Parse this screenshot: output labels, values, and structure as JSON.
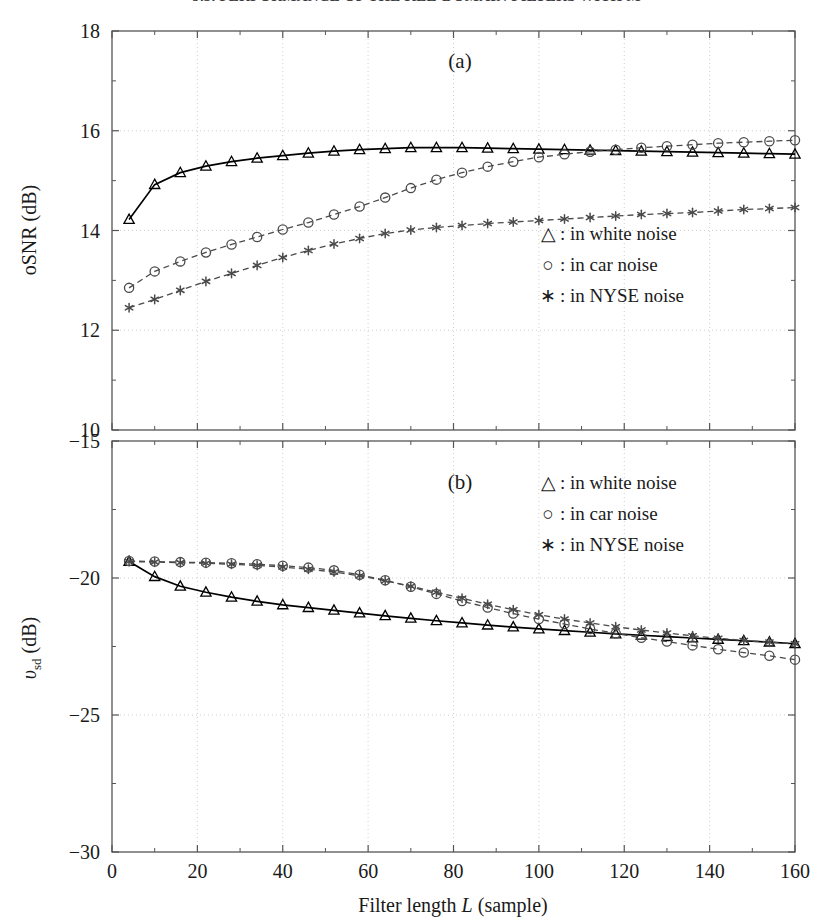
{
  "running_head": "9.5. PERFORMANCE OF THE KLE-DOMAIN FILTERS WITH M",
  "figure": {
    "xlabel_pre": "Filter length ",
    "xlabel_var": "L",
    "xlabel_post": " (sample)",
    "panels": [
      {
        "id": "a",
        "label": "(a)",
        "ylabel_main": "oSNR (dB)",
        "legend": [
          {
            "symbol": "△",
            "text": ": in white noise"
          },
          {
            "symbol": "○",
            "text": ": in car noise"
          },
          {
            "symbol": "∗",
            "text": ": in NYSE noise"
          }
        ]
      },
      {
        "id": "b",
        "label": "(b)",
        "ylabel_var": "υ",
        "ylabel_sub": "sd",
        "ylabel_unit": " (dB)",
        "legend": [
          {
            "symbol": "△",
            "text": ": in white noise"
          },
          {
            "symbol": "○",
            "text": ": in car noise"
          },
          {
            "symbol": "∗",
            "text": ": in NYSE noise"
          }
        ]
      }
    ]
  },
  "chart_data": [
    {
      "type": "line",
      "panel": "a",
      "title": "(a)",
      "xlabel": "Filter length L (sample)",
      "ylabel": "oSNR (dB)",
      "xlim": [
        0,
        160
      ],
      "ylim": [
        10,
        18
      ],
      "xticks": [
        0,
        20,
        40,
        60,
        80,
        100,
        120,
        140,
        160
      ],
      "yticks": [
        10,
        12,
        14,
        16,
        18
      ],
      "xminorticks": [
        10,
        30,
        50,
        70,
        90,
        110,
        130,
        150
      ],
      "yminorticks": [
        11,
        13,
        15,
        17
      ],
      "grid": true,
      "legend_position": "lower-right",
      "x": [
        4,
        10,
        16,
        22,
        28,
        34,
        40,
        46,
        52,
        58,
        64,
        70,
        76,
        82,
        88,
        94,
        100,
        106,
        112,
        118,
        124,
        130,
        136,
        142,
        148,
        154,
        160
      ],
      "series": [
        {
          "name": "in white noise",
          "marker": "triangle",
          "linestyle": "solid",
          "color": "#000000",
          "values": [
            14.22,
            14.92,
            15.16,
            15.29,
            15.38,
            15.45,
            15.5,
            15.55,
            15.59,
            15.62,
            15.64,
            15.66,
            15.66,
            15.66,
            15.65,
            15.64,
            15.63,
            15.62,
            15.61,
            15.6,
            15.59,
            15.58,
            15.57,
            15.56,
            15.55,
            15.54,
            15.53
          ]
        },
        {
          "name": "in car noise",
          "marker": "circle",
          "linestyle": "dashed",
          "color": "#4a4a4a",
          "values": [
            12.85,
            13.18,
            13.38,
            13.56,
            13.72,
            13.87,
            14.02,
            14.16,
            14.32,
            14.48,
            14.66,
            14.85,
            15.02,
            15.16,
            15.28,
            15.38,
            15.47,
            15.53,
            15.58,
            15.62,
            15.66,
            15.69,
            15.72,
            15.75,
            15.77,
            15.79,
            15.81
          ]
        },
        {
          "name": "in NYSE noise",
          "marker": "star",
          "linestyle": "dashed",
          "color": "#4a4a4a",
          "values": [
            12.45,
            12.62,
            12.8,
            12.98,
            13.14,
            13.3,
            13.46,
            13.6,
            13.73,
            13.84,
            13.94,
            14.01,
            14.06,
            14.1,
            14.14,
            14.17,
            14.2,
            14.23,
            14.26,
            14.29,
            14.32,
            14.34,
            14.36,
            14.39,
            14.42,
            14.44,
            14.46
          ]
        }
      ]
    },
    {
      "type": "line",
      "panel": "b",
      "title": "(b)",
      "xlabel": "Filter length L (sample)",
      "ylabel": "v_sd (dB)",
      "xlim": [
        0,
        160
      ],
      "ylim": [
        -30,
        -15
      ],
      "xticks": [
        0,
        20,
        40,
        60,
        80,
        100,
        120,
        140,
        160
      ],
      "yticks": [
        -30,
        -25,
        -20,
        -15
      ],
      "xminorticks": [
        10,
        30,
        50,
        70,
        90,
        110,
        130,
        150
      ],
      "yminorticks": [
        -27.5,
        -22.5,
        -17.5
      ],
      "grid": true,
      "legend_position": "upper-right",
      "x": [
        4,
        10,
        16,
        22,
        28,
        34,
        40,
        46,
        52,
        58,
        64,
        70,
        76,
        82,
        88,
        94,
        100,
        106,
        112,
        118,
        124,
        130,
        136,
        142,
        148,
        154,
        160
      ],
      "series": [
        {
          "name": "in white noise",
          "marker": "triangle",
          "linestyle": "solid",
          "color": "#000000",
          "values": [
            -19.4,
            -19.95,
            -20.3,
            -20.52,
            -20.7,
            -20.85,
            -20.98,
            -21.08,
            -21.18,
            -21.28,
            -21.38,
            -21.47,
            -21.56,
            -21.64,
            -21.72,
            -21.79,
            -21.86,
            -21.92,
            -21.98,
            -22.04,
            -22.09,
            -22.14,
            -22.19,
            -22.24,
            -22.29,
            -22.34,
            -22.4
          ]
        },
        {
          "name": "in car noise",
          "marker": "circle",
          "linestyle": "dashed",
          "color": "#4a4a4a",
          "values": [
            -19.38,
            -19.4,
            -19.42,
            -19.44,
            -19.46,
            -19.5,
            -19.55,
            -19.62,
            -19.72,
            -19.88,
            -20.08,
            -20.32,
            -20.58,
            -20.84,
            -21.08,
            -21.3,
            -21.5,
            -21.68,
            -21.86,
            -22.02,
            -22.18,
            -22.32,
            -22.46,
            -22.6,
            -22.72,
            -22.84,
            -22.98
          ]
        },
        {
          "name": "in NYSE noise",
          "marker": "star",
          "linestyle": "dashed",
          "color": "#4a4a4a",
          "values": [
            -19.4,
            -19.42,
            -19.44,
            -19.46,
            -19.5,
            -19.54,
            -19.6,
            -19.68,
            -19.78,
            -19.92,
            -20.1,
            -20.3,
            -20.52,
            -20.74,
            -20.96,
            -21.16,
            -21.34,
            -21.5,
            -21.64,
            -21.78,
            -21.9,
            -22.01,
            -22.11,
            -22.2,
            -22.28,
            -22.34,
            -22.4
          ]
        }
      ]
    }
  ]
}
